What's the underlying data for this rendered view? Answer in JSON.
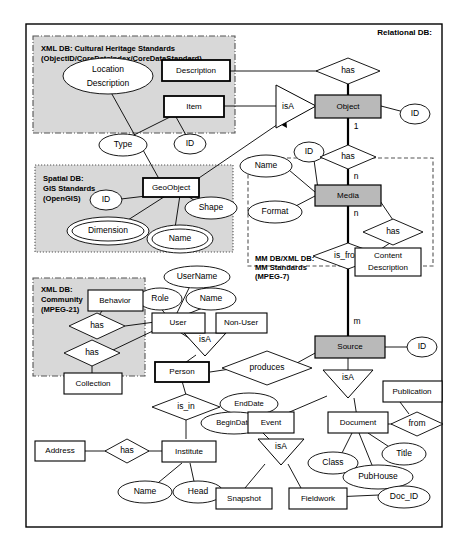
{
  "diagram": {
    "title": "Relational DB:",
    "frame_label": "Relational DB:",
    "regions": [
      {
        "id": "xml_heritage",
        "lines": [
          "XML DB: Cultural Heritage Standards",
          "(ObjectID/CoreDataIndex/CoreDataStandard)"
        ]
      },
      {
        "id": "spatial",
        "lines": [
          "Spatial DB:",
          "GIS Standards",
          "(OpenGIS)"
        ]
      },
      {
        "id": "mm",
        "lines": [
          "MM DB/XML DB:",
          "MM Standards",
          "(MPEG-7)"
        ]
      },
      {
        "id": "community",
        "lines": [
          "XML DB:",
          "Community",
          "(MPEG-21)"
        ]
      }
    ],
    "entities": [
      {
        "id": "description",
        "label": "Description",
        "style": "plain"
      },
      {
        "id": "item",
        "label": "Item",
        "style": "strong"
      },
      {
        "id": "object",
        "label": "Object",
        "style": "shaded"
      },
      {
        "id": "geoobject",
        "label": "GeoObject",
        "style": "strong"
      },
      {
        "id": "media",
        "label": "Media",
        "style": "shaded"
      },
      {
        "id": "content_description",
        "label": "Content Description",
        "style": "plain"
      },
      {
        "id": "behavior",
        "label": "Behavior",
        "style": "plain"
      },
      {
        "id": "collection",
        "label": "Collection",
        "style": "plain"
      },
      {
        "id": "user",
        "label": "User",
        "style": "plain"
      },
      {
        "id": "nonuser",
        "label": "Non-User",
        "style": "plain"
      },
      {
        "id": "person",
        "label": "Person",
        "style": "strong"
      },
      {
        "id": "source",
        "label": "Source",
        "style": "shaded"
      },
      {
        "id": "address",
        "label": "Address",
        "style": "plain"
      },
      {
        "id": "institute",
        "label": "Institute",
        "style": "plain"
      },
      {
        "id": "event",
        "label": "Event",
        "style": "plain"
      },
      {
        "id": "document",
        "label": "Document",
        "style": "plain"
      },
      {
        "id": "publication",
        "label": "Publication",
        "style": "plain"
      },
      {
        "id": "snapshot",
        "label": "Snapshot",
        "style": "plain"
      },
      {
        "id": "fieldwork",
        "label": "Fieldwork",
        "style": "plain"
      }
    ],
    "attributes": [
      {
        "id": "location_description",
        "label": "Location Description",
        "multi": false
      },
      {
        "id": "type",
        "label": "Type",
        "multi": false
      },
      {
        "id": "id_item",
        "label": "ID",
        "multi": false
      },
      {
        "id": "id_object",
        "label": "ID",
        "multi": false
      },
      {
        "id": "id_geo",
        "label": "ID",
        "multi": false
      },
      {
        "id": "shape",
        "label": "Shape",
        "multi": false
      },
      {
        "id": "dimension",
        "label": "Dimension",
        "multi": true
      },
      {
        "id": "name_geo",
        "label": "Name",
        "multi": true
      },
      {
        "id": "name_media",
        "label": "Name",
        "multi": false
      },
      {
        "id": "id_media",
        "label": "ID",
        "multi": false
      },
      {
        "id": "format",
        "label": "Format",
        "multi": false
      },
      {
        "id": "username",
        "label": "UserName",
        "multi": false
      },
      {
        "id": "role",
        "label": "Role",
        "multi": false
      },
      {
        "id": "name_user",
        "label": "Name",
        "multi": false
      },
      {
        "id": "id_source",
        "label": "ID",
        "multi": false
      },
      {
        "id": "enddate",
        "label": "EndDate",
        "multi": false
      },
      {
        "id": "begindate",
        "label": "BeginDate",
        "multi": false
      },
      {
        "id": "name_inst",
        "label": "Name",
        "multi": false
      },
      {
        "id": "head",
        "label": "Head",
        "multi": false
      },
      {
        "id": "class",
        "label": "Class",
        "multi": false
      },
      {
        "id": "title",
        "label": "Title",
        "multi": false
      },
      {
        "id": "pubhouse",
        "label": "PubHouse",
        "multi": false
      },
      {
        "id": "doc_id",
        "label": "Doc_ID",
        "multi": false
      }
    ],
    "relationships": [
      {
        "id": "has_object_description",
        "label": "has"
      },
      {
        "id": "has_object_media",
        "label": "has"
      },
      {
        "id": "has_media_content",
        "label": "has"
      },
      {
        "id": "is_from",
        "label": "is_from"
      },
      {
        "id": "has_behavior",
        "label": "has"
      },
      {
        "id": "has_collection",
        "label": "has"
      },
      {
        "id": "produces",
        "label": "produces"
      },
      {
        "id": "is_in",
        "label": "is_in"
      },
      {
        "id": "has_address",
        "label": "has"
      },
      {
        "id": "from",
        "label": "from"
      }
    ],
    "isa_nodes": [
      {
        "id": "isa_object",
        "label": "isA"
      },
      {
        "id": "isa_user",
        "label": "isA"
      },
      {
        "id": "isa_source",
        "label": "isA"
      },
      {
        "id": "isa_event",
        "label": "isA"
      }
    ],
    "cardinalities": [
      {
        "id": "card_object_1",
        "label": "1"
      },
      {
        "id": "card_media_n_top",
        "label": "n"
      },
      {
        "id": "card_media_n_bottom",
        "label": "n"
      },
      {
        "id": "card_source_m",
        "label": "m"
      }
    ]
  }
}
